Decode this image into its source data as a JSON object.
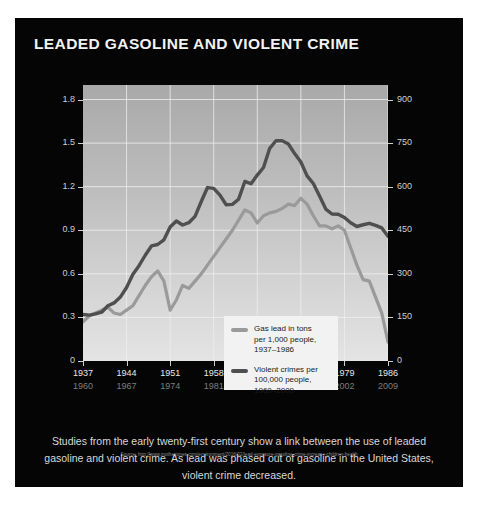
{
  "panel": {
    "title": "LEADED GASOLINE AND VIOLENT CRIME",
    "background_color": "#050505"
  },
  "caption": "Studies from the early twenty-first century show a link between the use of leaded gasoline and violent crime. As lead was phased out of gasoline in the United States, violent crime decreased.",
  "source": "Source: http://www.motherjones.com/environment/2016/02/lead-exposure-gasoline-crime-increase-children-health",
  "legend": {
    "items": [
      {
        "swatch_color": "#9a9a9a",
        "line1": "Gas lead in tons",
        "line2": "per 1,000 people,",
        "line3": "1937–1986"
      },
      {
        "swatch_color": "#4f4f4f",
        "line1": "Violent crimes per",
        "line2": "100,000 people,",
        "line3": "1960–2009"
      }
    ]
  },
  "chart_data": {
    "type": "line",
    "title": "LEADED GASOLINE AND VIOLENT CRIME",
    "xlabel": "",
    "ylabel": "",
    "grid": true,
    "legend_position": "inside-lower-center",
    "axes": {
      "left": {
        "label": "Gas lead in tons per 1,000 people",
        "ticks": [
          "0",
          "0.3",
          "0.6",
          "0.9",
          "1.2",
          "1.5",
          "1.8"
        ],
        "tick_values": [
          0,
          0.3,
          0.6,
          0.9,
          1.2,
          1.5,
          1.8
        ],
        "ylim": [
          0,
          1.9
        ],
        "color": "#cfcfcf"
      },
      "right": {
        "label": "Violent crimes per 100,000 people",
        "ticks": [
          "0",
          "150",
          "300",
          "450",
          "600",
          "750",
          "900"
        ],
        "tick_values": [
          0,
          150,
          300,
          450,
          600,
          750,
          900
        ],
        "ylim": [
          0,
          950
        ],
        "color": "#cfcfcf"
      },
      "x_top": {
        "label": "Gas lead year",
        "ticks": [
          "1937",
          "1944",
          "1951",
          "1958",
          "1965",
          "1972",
          "1979",
          "1986"
        ],
        "xlim": [
          1937,
          1986
        ],
        "color": "#e8e8e8"
      },
      "x_bottom": {
        "label": "Violent crime year (lagged 23 years)",
        "ticks": [
          "1960",
          "1967",
          "1974",
          "1981",
          "1988",
          "1995",
          "2002",
          "2009"
        ],
        "xlim": [
          1960,
          2009
        ],
        "color": "#7d7d7d"
      }
    },
    "series": [
      {
        "name": "Gas lead in tons per 1,000 people, 1937–1986",
        "axis": "left",
        "color": "#9a9a9a",
        "x": [
          1937,
          1938,
          1939,
          1940,
          1941,
          1942,
          1943,
          1944,
          1945,
          1946,
          1947,
          1948,
          1949,
          1950,
          1951,
          1952,
          1953,
          1954,
          1955,
          1956,
          1957,
          1958,
          1959,
          1960,
          1961,
          1962,
          1963,
          1964,
          1965,
          1966,
          1967,
          1968,
          1969,
          1970,
          1971,
          1972,
          1973,
          1974,
          1975,
          1976,
          1977,
          1978,
          1979,
          1980,
          1981,
          1982,
          1983,
          1984,
          1985,
          1986
        ],
        "values": [
          0.27,
          0.31,
          0.33,
          0.35,
          0.37,
          0.33,
          0.32,
          0.35,
          0.38,
          0.45,
          0.52,
          0.58,
          0.62,
          0.55,
          0.35,
          0.42,
          0.52,
          0.5,
          0.55,
          0.6,
          0.66,
          0.72,
          0.78,
          0.84,
          0.9,
          0.97,
          1.04,
          1.02,
          0.95,
          1.0,
          1.02,
          1.03,
          1.05,
          1.08,
          1.07,
          1.12,
          1.08,
          1.0,
          0.93,
          0.93,
          0.91,
          0.93,
          0.9,
          0.78,
          0.66,
          0.56,
          0.55,
          0.44,
          0.33,
          0.13
        ]
      },
      {
        "name": "Violent crimes per 100,000 people, 1960–2009",
        "axis": "right",
        "color": "#4f4f4f",
        "x": [
          1960,
          1961,
          1962,
          1963,
          1964,
          1965,
          1966,
          1967,
          1968,
          1969,
          1970,
          1971,
          1972,
          1973,
          1974,
          1975,
          1976,
          1977,
          1978,
          1979,
          1980,
          1981,
          1982,
          1983,
          1984,
          1985,
          1986,
          1987,
          1988,
          1989,
          1990,
          1991,
          1992,
          1993,
          1994,
          1995,
          1996,
          1997,
          1998,
          1999,
          2000,
          2001,
          2002,
          2003,
          2004,
          2005,
          2006,
          2007,
          2008,
          2009
        ],
        "values": [
          160,
          158,
          162,
          168,
          190,
          200,
          220,
          253,
          298,
          328,
          364,
          396,
          401,
          417,
          461,
          482,
          468,
          476,
          498,
          549,
          597,
          594,
          571,
          538,
          539,
          557,
          618,
          610,
          640,
          666,
          732,
          758,
          758,
          747,
          714,
          685,
          637,
          611,
          568,
          523,
          506,
          505,
          494,
          476,
          463,
          469,
          474,
          467,
          458,
          429
        ]
      }
    ]
  }
}
